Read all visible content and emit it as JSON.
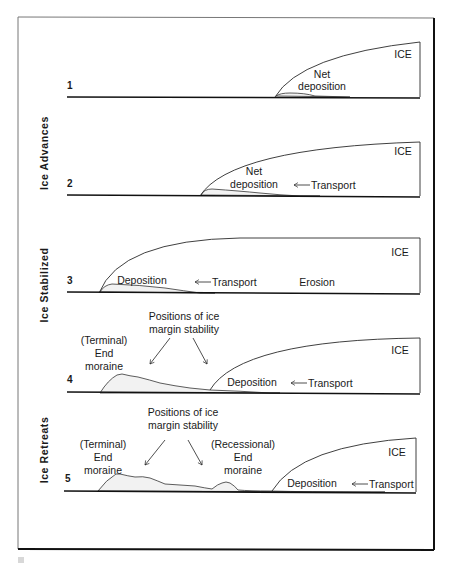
{
  "figure": {
    "frame": {
      "border_color": "#1a1a1a",
      "background": "#ffffff"
    },
    "side_labels": [
      {
        "id": "advances",
        "text": "Ice Advances"
      },
      {
        "id": "stabilized",
        "text": "Ice Stabilized"
      },
      {
        "id": "retreats",
        "text": "Ice Retreats"
      }
    ],
    "panels": [
      {
        "number": "1",
        "ice_label": "ICE",
        "labels": {
          "net": "Net",
          "deposition": "deposition"
        }
      },
      {
        "number": "2",
        "ice_label": "ICE",
        "labels": {
          "net": "Net",
          "deposition": "deposition",
          "transport": "Transport"
        }
      },
      {
        "number": "3",
        "ice_label": "ICE",
        "labels": {
          "deposition": "Deposition",
          "transport": "Transport",
          "erosion": "Erosion"
        }
      },
      {
        "number": "4",
        "ice_label": "ICE",
        "labels": {
          "positions_line1": "Positions of ice",
          "positions_line2": "margin stability",
          "terminal_line1": "(Terminal)",
          "terminal_line2": "End",
          "terminal_line3": "moraine",
          "deposition": "Deposition",
          "transport": "Transport"
        }
      },
      {
        "number": "5",
        "ice_label": "ICE",
        "labels": {
          "positions_line1": "Positions of ice",
          "positions_line2": "margin stability",
          "terminal_line1": "(Terminal)",
          "terminal_line2": "End",
          "terminal_line3": "moraine",
          "recessional_line1": "(Recessional)",
          "recessional_line2": "End",
          "recessional_line3": "moraine",
          "deposition": "Deposition",
          "transport": "Transport"
        }
      }
    ]
  }
}
